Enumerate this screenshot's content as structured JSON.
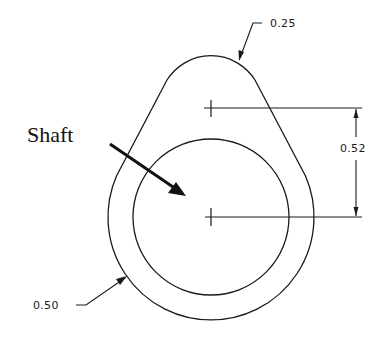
{
  "diagram": {
    "type": "cam-profile-technical-drawing",
    "labels": {
      "shaft": "Shaft",
      "top_radius": "0.25",
      "center_distance": "0.52",
      "base_radius": "0.50"
    },
    "colors": {
      "line": "#1a1a1a",
      "background": "#ffffff"
    },
    "geometry": {
      "base_center": [
        211,
        217
      ],
      "nose_center": [
        211,
        108
      ],
      "outer_base_radius_px": 103,
      "inner_shaft_radius_px": 78,
      "nose_radius_px": 52
    }
  }
}
